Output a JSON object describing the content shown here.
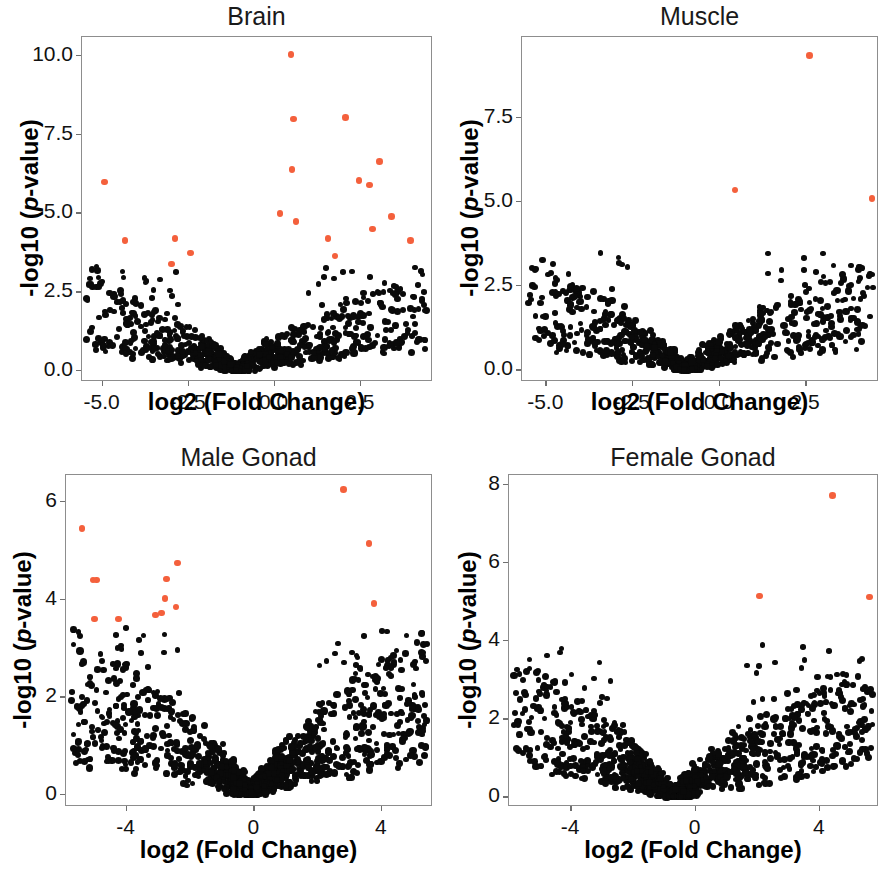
{
  "figure": {
    "panel_count": 4,
    "significant_color": "#f4603c",
    "nonsignificant_color": "#0a0a0a"
  },
  "axis_labels": {
    "x": "log2 (Fold Change)",
    "y_prefix": "-log10 (",
    "y_italic": "p",
    "y_suffix": "-value)"
  },
  "chart_data": [
    {
      "type": "scatter",
      "title": "Brain",
      "xlabel": "log2 (Fold Change)",
      "ylabel": "-log10 (p-value)",
      "xlim": [
        -5.6,
        4.6
      ],
      "ylim": [
        -0.35,
        10.6
      ],
      "xticks": [
        -5.0,
        -2.5,
        0.0,
        2.5
      ],
      "xticklabels": [
        "-5.0",
        "-2.5",
        "0.0",
        "2.5"
      ],
      "yticks": [
        0.0,
        2.5,
        5.0,
        7.5,
        10.0
      ],
      "yticklabels": [
        "0.0",
        "2.5",
        "5.0",
        "7.5",
        "10.0"
      ],
      "grid": false,
      "legend": "none",
      "series": [
        {
          "name": "significant",
          "color": "#f4603c",
          "points": [
            [
              0.47,
              10.05
            ],
            [
              0.55,
              8.0
            ],
            [
              2.05,
              8.05
            ],
            [
              3.05,
              6.65
            ],
            [
              0.5,
              6.4
            ],
            [
              2.45,
              6.05
            ],
            [
              2.75,
              5.9
            ],
            [
              -4.95,
              6.0
            ],
            [
              0.15,
              5.0
            ],
            [
              0.62,
              4.75
            ],
            [
              3.4,
              4.9
            ],
            [
              2.85,
              4.5
            ],
            [
              1.55,
              4.2
            ],
            [
              3.95,
              4.15
            ],
            [
              -4.35,
              4.15
            ],
            [
              -2.9,
              4.2
            ],
            [
              -2.45,
              3.75
            ],
            [
              1.75,
              3.65
            ],
            [
              -3.0,
              3.4
            ]
          ]
        },
        {
          "name": "not-significant",
          "color": "#0a0a0a",
          "summary": "dense V-shaped cloud, vertex near x=-1.1, y=0; wings rise to y~3.4 at the extremes",
          "vertex_x": -1.1,
          "max_y": 3.4,
          "approx_count": 900
        }
      ]
    },
    {
      "type": "scatter",
      "title": "Muscle",
      "xlabel": "log2 (Fold Change)",
      "ylabel": "-log10 (p-value)",
      "xlim": [
        -5.7,
        4.6
      ],
      "ylim": [
        -0.35,
        9.9
      ],
      "xticks": [
        -5.0,
        -2.5,
        0.0,
        2.5
      ],
      "xticklabels": [
        "-5.0",
        "-2.5",
        "0.0",
        "2.5"
      ],
      "yticks": [
        0.0,
        2.5,
        5.0,
        7.5
      ],
      "yticklabels": [
        "0.0",
        "2.5",
        "5.0",
        "7.5"
      ],
      "grid": false,
      "legend": "none",
      "series": [
        {
          "name": "significant",
          "color": "#f4603c",
          "points": [
            [
              2.6,
              9.35
            ],
            [
              0.45,
              5.35
            ],
            [
              4.4,
              5.1
            ]
          ]
        },
        {
          "name": "not-significant",
          "color": "#0a0a0a",
          "summary": "dense V-shaped cloud, vertex near x=-1.0, y=0; one outlier at (0.45, 3.5)",
          "vertex_x": -1.0,
          "max_y": 3.5,
          "approx_count": 900
        }
      ]
    },
    {
      "type": "scatter",
      "title": "Male Gonad",
      "xlabel": "log2 (Fold Change)",
      "ylabel": "-log10 (p-value)",
      "xlim": [
        -5.9,
        5.6
      ],
      "ylim": [
        -0.25,
        6.55
      ],
      "xticks": [
        -4,
        0,
        4
      ],
      "xticklabels": [
        "-4",
        "0",
        "4"
      ],
      "yticks": [
        0,
        2,
        4,
        6
      ],
      "yticklabels": [
        "0",
        "2",
        "4",
        "6"
      ],
      "grid": false,
      "legend": "none",
      "series": [
        {
          "name": "significant",
          "color": "#f4603c",
          "points": [
            [
              2.8,
              6.25
            ],
            [
              -5.4,
              5.45
            ],
            [
              3.6,
              5.15
            ],
            [
              -2.4,
              4.75
            ],
            [
              -5.05,
              4.4
            ],
            [
              -4.95,
              4.4
            ],
            [
              -2.75,
              4.42
            ],
            [
              -2.8,
              4.02
            ],
            [
              3.75,
              3.92
            ],
            [
              -2.45,
              3.85
            ],
            [
              -2.9,
              3.72
            ],
            [
              -3.1,
              3.68
            ],
            [
              -5.0,
              3.6
            ],
            [
              -4.25,
              3.6
            ]
          ]
        },
        {
          "name": "not-significant",
          "color": "#0a0a0a",
          "summary": "dense V-shaped cloud, vertex near x=-0.1, y=0; wings rise to y~3.45",
          "vertex_x": -0.1,
          "max_y": 3.45,
          "approx_count": 1300
        }
      ]
    },
    {
      "type": "scatter",
      "title": "Female Gonad",
      "xlabel": "log2 (Fold Change)",
      "ylabel": "-log10 (p-value)",
      "xlim": [
        -6.0,
        5.9
      ],
      "ylim": [
        -0.25,
        8.25
      ],
      "xticks": [
        -4,
        0,
        4
      ],
      "xticklabels": [
        "-4",
        "0",
        "4"
      ],
      "yticks": [
        0,
        2,
        4,
        6,
        8
      ],
      "yticklabels": [
        "0",
        "2",
        "4",
        "6",
        "8"
      ],
      "grid": false,
      "legend": "none",
      "series": [
        {
          "name": "significant",
          "color": "#f4603c",
          "points": [
            [
              4.4,
              7.72
            ],
            [
              2.05,
              5.15
            ],
            [
              5.6,
              5.13
            ]
          ]
        },
        {
          "name": "not-significant",
          "color": "#0a0a0a",
          "summary": "dense V-shaped cloud, vertex near x=-0.7, y=0; right wing reaches y~3.9",
          "vertex_x": -0.7,
          "max_y": 3.9,
          "approx_count": 1200
        }
      ]
    }
  ],
  "panels": [
    {
      "id": "brain",
      "title": "Brain",
      "frame": {
        "left": 81,
        "top": 36,
        "width": 351,
        "height": 345
      },
      "title_top": 2,
      "xlab_top": 388,
      "ylab_center_y": 208,
      "ylab_left": 12
    },
    {
      "id": "muscle",
      "title": "Muscle",
      "frame": {
        "left": 521,
        "top": 36,
        "width": 357,
        "height": 345
      },
      "title_top": 2,
      "xlab_top": 388,
      "ylab_center_y": 208,
      "ylab_left": 452
    },
    {
      "id": "male-gonad",
      "title": "Male Gonad",
      "frame": {
        "left": 65,
        "top": 474,
        "width": 367,
        "height": 332
      },
      "title_top": 443,
      "xlab_top": 836,
      "ylab_center_y": 640,
      "ylab_left": 5
    },
    {
      "id": "female-gonad",
      "title": "Female Gonad",
      "frame": {
        "left": 508,
        "top": 474,
        "width": 370,
        "height": 332
      },
      "title_top": 443,
      "xlab_top": 836,
      "ylab_center_y": 640,
      "ylab_left": 450
    }
  ]
}
